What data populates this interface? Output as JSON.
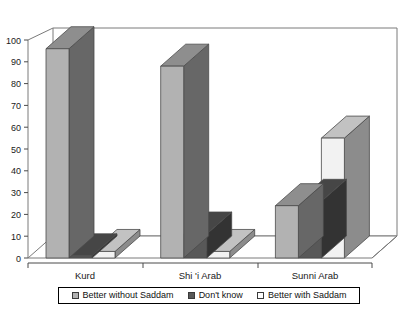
{
  "chart_data": {
    "type": "bar",
    "title": "",
    "xlabel": "",
    "ylabel": "",
    "categories": [
      "Kurd",
      "Shi 'i Arab",
      "Sunni Arab"
    ],
    "series": [
      {
        "name": "Better without Saddam",
        "color": "#b2b2b2",
        "values": [
          96,
          88,
          24
        ]
      },
      {
        "name": "Don't know",
        "color": "#585858",
        "values": [
          1,
          11,
          26
        ]
      },
      {
        "name": "Better with Saddam",
        "color": "#f2f2f2",
        "values": [
          3,
          3,
          55
        ]
      }
    ],
    "ylim": [
      0,
      100
    ],
    "yticks": [
      0,
      10,
      20,
      30,
      40,
      50,
      60,
      70,
      80,
      90,
      100
    ],
    "grid": false,
    "legend_position": "bottom",
    "style": "3d-column"
  },
  "legend": {
    "items": [
      {
        "label": "Better without Saddam",
        "swatch": "#b2b2b2"
      },
      {
        "label": "Don't know",
        "swatch": "#585858"
      },
      {
        "label": "Better with Saddam",
        "swatch": "#fdfdfd"
      }
    ]
  },
  "axis": {
    "y_tick_labels": [
      "100",
      "90",
      "80",
      "70",
      "60",
      "50",
      "40",
      "30",
      "20",
      "10",
      "0"
    ],
    "x_tick_labels": [
      "Kurd",
      "Shi 'i Arab",
      "Sunni Arab"
    ]
  },
  "title_remnant": {
    "text": ""
  }
}
